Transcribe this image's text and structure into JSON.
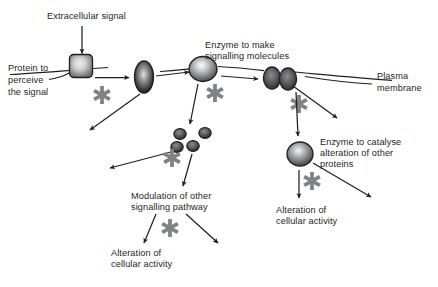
{
  "figure": {
    "background_color": "#ffffff",
    "text_color": "#231f20",
    "stroke_color": "#231f20",
    "asterisk_color": "#808285",
    "width": 438,
    "height": 287
  },
  "labels": {
    "extracellular_signal": "Extracellular signal",
    "protein_to_perceive_1": "Protein to",
    "protein_to_perceive_2": "perceive",
    "protein_to_perceive_3": "the signal",
    "enzyme_to_make_1": "Enzyme to make",
    "enzyme_to_make_2": "signalling molecules",
    "plasma_membrane_1": "Plasma",
    "plasma_membrane_2": "membrane",
    "enzyme_to_catalyse_1": "Enzyme to catalyse",
    "enzyme_to_catalyse_2": "alteration of other",
    "enzyme_to_catalyse_3": "proteins",
    "modulation_1": "Modulation of other",
    "modulation_2": "signalling pathway",
    "alteration_left_1": "Alteration of",
    "alteration_left_2": "cellular activity",
    "alteration_right_1": "Alteration of",
    "alteration_right_2": "cellular activity"
  },
  "elements": {
    "receptor_label": "membrane-receptor-square",
    "channel_label": "membrane-channel-ellipse",
    "enzyme_top_label": "signalling-enzyme-sphere",
    "enzyme_pair_label": "membrane-protein-pair",
    "enzyme_bottom_label": "catalytic-enzyme-sphere",
    "molecule_label": "signalling-molecule",
    "molecule_count": 4,
    "asterisk_glyph": "✳",
    "asterisk_count": 6
  },
  "colors": {
    "receptor_fill_center": "#e8e8e8",
    "receptor_fill_edge": "#6d6e70",
    "channel_fill_center": "#d9d9d9",
    "channel_fill_edge": "#1a1a1a",
    "enzyme_fill_center": "#f2f2f2",
    "enzyme_fill_edge": "#58595b",
    "molecule_fill_center": "#6d6e70",
    "molecule_fill_edge": "#2b2b2b",
    "asterisk": "#808285",
    "membrane_line": "#231f20"
  }
}
